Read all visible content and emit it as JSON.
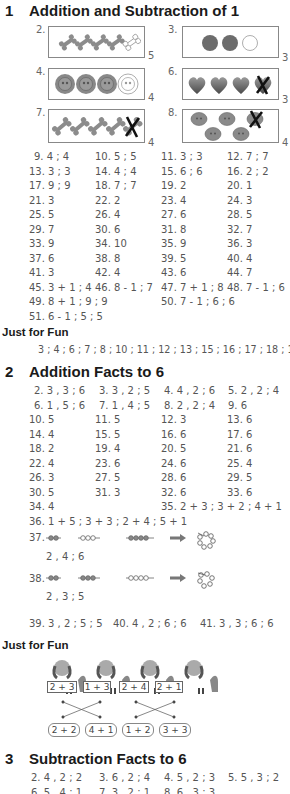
{
  "section1": {
    "number": "1",
    "title": "Addition and Subtraction of 1",
    "pictures": [
      {
        "label": "2.",
        "icon": "bone-icon",
        "filled": 4,
        "outlined": 1,
        "crossed": 0,
        "answer": "5"
      },
      {
        "label": "3.",
        "icon": "heart-icon",
        "filled": 2,
        "outlined": 1,
        "crossed": 0,
        "answer": "3"
      },
      {
        "label": "4.",
        "icon": "button-icon",
        "filled": 3,
        "outlined": 1,
        "crossed": 0,
        "answer": "4"
      },
      {
        "label": "6.",
        "icon": "heart-icon",
        "filled": 3,
        "outlined": 0,
        "crossed": 1,
        "answer": "3"
      },
      {
        "label": "7.",
        "icon": "bone-icon",
        "filled": 4,
        "outlined": 0,
        "crossed": 1,
        "answer": "4"
      },
      {
        "label": "8.",
        "icon": "button-icon",
        "filled": 4,
        "outlined": 0,
        "crossed": 1,
        "answer": "4"
      }
    ],
    "answers": [
      [
        "9. 4 ; 4",
        "10. 5 ; 5",
        "11. 3 ; 3",
        "12. 7 ; 7"
      ],
      [
        "13. 3 ; 3",
        "14. 4 ; 4",
        "15. 6 ; 6",
        "16. 2 ; 2"
      ],
      [
        "17. 9 ; 9",
        "18. 7 ; 7",
        "19. 2",
        "20. 1"
      ],
      [
        "21. 3",
        "22. 2",
        "23. 4",
        "24. 3"
      ],
      [
        "25. 5",
        "26. 4",
        "27. 6",
        "28. 5"
      ],
      [
        "29. 7",
        "30. 6",
        "31. 8",
        "32. 7"
      ],
      [
        "33. 9",
        "34. 10",
        "35. 9",
        "36. 3"
      ],
      [
        "37. 6",
        "38. 8",
        "39. 5",
        "40. 4"
      ],
      [
        "41. 3",
        "42. 4",
        "43. 6",
        "44. 7"
      ],
      [
        "45. 3 + 1 ; 4",
        "46. 8 - 1 ; 7",
        "47. 7 + 1 ; 8",
        "48. 7 - 1 ; 6"
      ]
    ],
    "answer_49": "49. 8 + 1 ; 9 ; 9",
    "answer_50": "50. 7 - 1 ; 6 ; 6",
    "answer_51": "51. 6 - 1 ; 5 ; 5",
    "just_for_fun": {
      "title": "Just for Fun",
      "answer": "3 ; 4 ; 6 ; 7 ; 8 ; 10 ; 11 ; 12 ; 13 ; 15 ; 16 ; 17 ; 18 ; 19"
    }
  },
  "section2": {
    "number": "2",
    "title": "Addition Facts to 6",
    "answers": [
      [
        "2. 3 , 3 ; 6",
        "3. 3 , 2 ; 5",
        "4. 4 , 2 ; 6",
        "5. 2 , 2 ; 4"
      ],
      [
        "6. 1 , 5 ; 6",
        "7. 1 , 4 ; 5",
        "8. 2 , 2 ; 4",
        "9. 6"
      ],
      [
        "10. 5",
        "11. 5",
        "12. 3",
        "13. 6"
      ],
      [
        "14. 4",
        "15. 5",
        "16. 6",
        "17. 6"
      ],
      [
        "18. 2",
        "19. 4",
        "20. 5",
        "21. 6"
      ],
      [
        "22. 4",
        "23. 6",
        "24. 6",
        "25. 4"
      ],
      [
        "26. 3",
        "27. 5",
        "28. 6",
        "29. 5"
      ],
      [
        "30. 5",
        "31. 3",
        "32. 6",
        "33. 6"
      ]
    ],
    "answer_34": "34. 4",
    "answer_35": "35. 2 + 3 ; 3 + 2 ; 4 + 1",
    "answer_36": "36. 1 + 5 ; 3 + 3 ; 2 + 4 ; 5 + 1",
    "bead_problems": [
      {
        "label": "37.",
        "groups": [
          2,
          3,
          4
        ],
        "answer": "2 , 4 ; 6"
      },
      {
        "label": "38.",
        "groups": [
          2,
          3,
          4
        ],
        "answer": "2 , 3 ; 5"
      }
    ],
    "row_39_41": [
      "39. 3 , 2 ; 5 ; 5",
      "40. 4 , 2 ; 6 ; 6",
      "41. 3 , 3 ; 6 ; 6"
    ],
    "just_for_fun": {
      "title": "Just for Fun",
      "dogs": [
        "2 + 3",
        "1 + 3",
        "2 + 4",
        "2 + 1"
      ],
      "bones": [
        "2 + 2",
        "4 + 1",
        "1 + 2",
        "3 + 3"
      ]
    }
  },
  "section3": {
    "number": "3",
    "title": "Subtraction Facts to 6",
    "answers": [
      [
        "2. 4 , 2 ; 2",
        "3. 6 , 2 ; 4",
        "4. 5 , 2 ; 3",
        "5. 5 , 3 ; 2"
      ],
      [
        "6. 5 , 4 ; 1",
        "7. 3 , 2 ; 1",
        "8. 6 , 3 ; 3",
        ""
      ]
    ]
  },
  "colors": {
    "heading": "#1a1a1a",
    "text": "#555555",
    "icon_fill": "#888888",
    "icon_dark": "#6a6a6a",
    "cross": "#111111"
  }
}
